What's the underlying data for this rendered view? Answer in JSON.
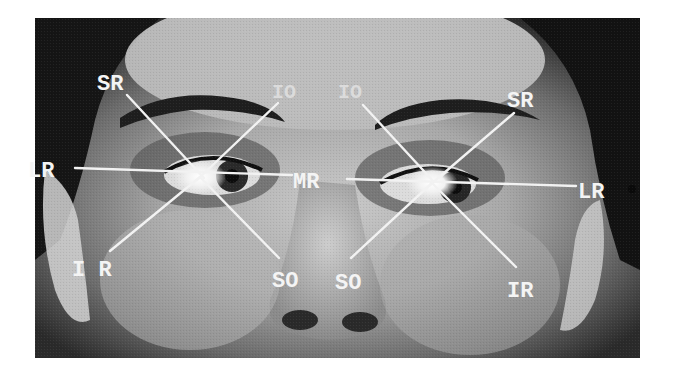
{
  "figure": {
    "photo_bounds": {
      "x": 35,
      "y": 18,
      "width": 605,
      "height": 340
    },
    "colors": {
      "background": "#ffffff",
      "label": "#f4f4f4",
      "line": "#f2f2f2",
      "photo_dark": "#1a1a1a",
      "photo_mid": "#6e6e6e",
      "photo_light": "#c8c8c8"
    }
  },
  "labels": {
    "left_eye": {
      "center": [
        200,
        177
      ],
      "LR": "LR",
      "SR": "SR",
      "IO": "IO",
      "IR": "I R",
      "SO": "SO"
    },
    "center": {
      "MR": "MR"
    },
    "right_eye": {
      "center": [
        432,
        183
      ],
      "LR": "LR",
      "SR": "SR",
      "IO": "IO",
      "IR": "IR",
      "SO": "SO"
    }
  },
  "legend_terms": [
    "LR",
    "MR",
    "SR",
    "IR",
    "SO",
    "IO"
  ]
}
